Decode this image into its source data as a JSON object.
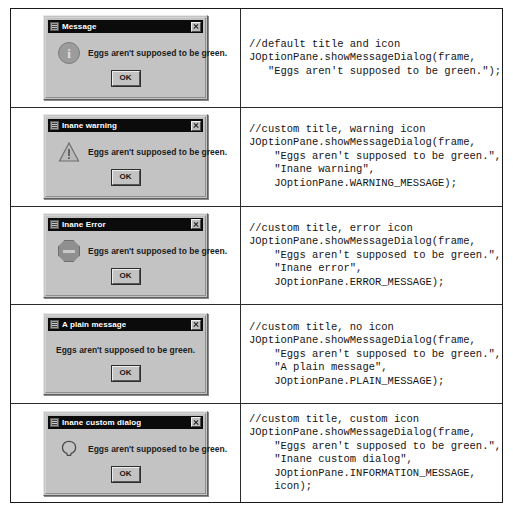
{
  "document": {
    "caption": "",
    "message_text": "Eggs aren't supposed to be green.",
    "ok_label": "OK"
  },
  "rows": [
    {
      "dialog": {
        "title": "Message",
        "message": "Eggs aren't supposed to be green.",
        "button": "OK",
        "icon": "info-icon",
        "has_icon": true
      },
      "code": "//default title and icon\nJOptionPane.showMessageDialog(frame,\n   \"Eggs aren't supposed to be green.\");"
    },
    {
      "dialog": {
        "title": "Inane warning",
        "message": "Eggs aren't supposed to be green.",
        "button": "OK",
        "icon": "warning-icon",
        "has_icon": true
      },
      "code": "//custom title, warning icon\nJOptionPane.showMessageDialog(frame,\n    \"Eggs aren't supposed to be green.\",\n    \"Inane warning\",\n    JOptionPane.WARNING_MESSAGE);"
    },
    {
      "dialog": {
        "title": "Inane Error",
        "message": "Eggs aren't supposed to be green.",
        "button": "OK",
        "icon": "error-icon",
        "has_icon": true
      },
      "code": "//custom title, error icon\nJOptionPane.showMessageDialog(frame,\n    \"Eggs aren't supposed to be green.\",\n    \"Inane error\",\n    JOptionPane.ERROR_MESSAGE);"
    },
    {
      "dialog": {
        "title": "A plain message",
        "message": "Eggs aren't supposed to be green.",
        "button": "OK",
        "icon": "none",
        "has_icon": false
      },
      "code": "//custom title, no icon\nJOptionPane.showMessageDialog(frame,\n    \"Eggs aren't supposed to be green.\",\n    \"A plain message\",\n    JOptionPane.PLAIN_MESSAGE);"
    },
    {
      "dialog": {
        "title": "Inane custom dialog",
        "message": "Eggs aren't supposed to be green.",
        "button": "OK",
        "icon": "custom-icon",
        "has_icon": true
      },
      "code": "//custom title, custom icon\nJOptionPane.showMessageDialog(frame,\n    \"Eggs aren't supposed to be green.\",\n    \"Inane custom dialog\",\n    JOptionPane.INFORMATION_MESSAGE,\n    icon);"
    }
  ],
  "colors": {
    "dialog_face": "#c3c3c3",
    "titlebar": "#0b0b0b",
    "titlebar_text": "#ffffff",
    "border": "#1a1a1a",
    "code_text": "#151515"
  }
}
